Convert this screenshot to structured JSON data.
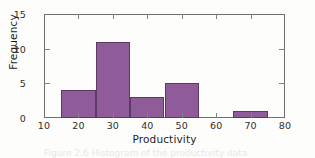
{
  "chart_data": {
    "type": "bar",
    "subtype": "histogram",
    "title": "",
    "xlabel": "Productivity",
    "ylabel": "Frequency",
    "xlim": [
      10,
      80
    ],
    "ylim": [
      0,
      15
    ],
    "xticks": [
      10,
      20,
      30,
      40,
      50,
      60,
      70,
      80
    ],
    "xtick_labels": [
      "10",
      "20",
      "30",
      "40",
      "50",
      "60",
      "70",
      "80"
    ],
    "yticks": [
      0,
      5,
      10,
      15
    ],
    "ytick_labels": [
      "0",
      "5",
      "10",
      "15"
    ],
    "grid": false,
    "legend": null,
    "bin_width": 10,
    "bin_edges": [
      15,
      25,
      35,
      45,
      55,
      65,
      75
    ],
    "categories": [
      "15-25",
      "25-35",
      "35-45",
      "45-55",
      "55-65",
      "65-75"
    ],
    "values": [
      4,
      11,
      3,
      5,
      0,
      1
    ],
    "bar_color": "#8f5b98",
    "bar_edge_color": "#5d3a66",
    "axis_color": "#6f6f72",
    "background_color": "#fdfdfb"
  },
  "caption": {
    "text": "Figure 2.6  Histogram of the productivity data"
  }
}
